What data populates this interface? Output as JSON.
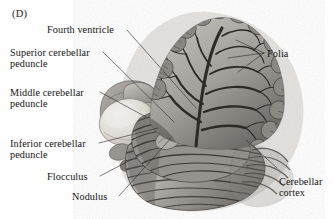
{
  "figure": {
    "panel_label": "(D)",
    "background_color": "#fefefe",
    "ink_color": "#151515",
    "leader_line_color": "#3a3a3a"
  },
  "labels": {
    "fourth_ventricle": "Fourth ventricle",
    "superior_cerebellar_peduncle_l1": "Superior cerebellar",
    "superior_cerebellar_peduncle_l2": "peduncle",
    "middle_cerebellar_peduncle_l1": "Middle cerebellar",
    "middle_cerebellar_peduncle_l2": "peduncle",
    "inferior_cerebellar_peduncle_l1": "Inferior cerebellar",
    "inferior_cerebellar_peduncle_l2": "peduncle",
    "flocculus": "Flocculus",
    "nodulus": "Nodulus",
    "folia": "Folia",
    "cerebellar_cortex_l1": "Cerebellar",
    "cerebellar_cortex_l2": "cortex"
  },
  "anatomy": {
    "regions": [
      {
        "name": "arbor-vitae",
        "description": "tree-like branching white matter of cerebellum, upper center-right"
      },
      {
        "name": "cerebellar-cortex-folia",
        "description": "horizontally ridged cortical folds, lower right lobe"
      },
      {
        "name": "flocculus",
        "description": "pale rounded lobule, left of center"
      },
      {
        "name": "peduncle-cluster",
        "description": "cut peduncle stalks, left center"
      },
      {
        "name": "nodulus",
        "description": "small midline lobule at inferior vermis"
      }
    ],
    "palette": {
      "tissue_light": "#d8d5d2",
      "tissue_mid": "#a8a5a2",
      "tissue_dark": "#6b6866",
      "tissue_deepest": "#3c3a38",
      "pale_lobule": "#ece9e4"
    }
  }
}
